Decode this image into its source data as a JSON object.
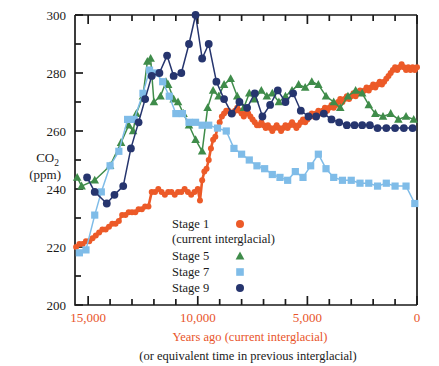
{
  "chart_data": {
    "type": "line",
    "title": "",
    "xlabel": "Years ago (current interglacial)",
    "xlabel_sub": "(or equivalent time in previous interglacial)",
    "ylabel_line1": "CO",
    "ylabel_sub": "2",
    "ylabel_line2": "(ppm)",
    "xlim": [
      15600,
      0
    ],
    "ylim": [
      200,
      300
    ],
    "x_reversed": true,
    "x_major_ticks": [
      15000,
      10000,
      5000,
      0
    ],
    "x_major_tick_labels": [
      "15,000",
      "10,000",
      "5,000",
      "0"
    ],
    "x_minor_tick_step": 1000,
    "y_major_ticks": [
      200,
      220,
      240,
      260,
      280,
      300
    ],
    "y_major_tick_labels": [
      "200",
      "220",
      "240",
      "260",
      "280",
      "300"
    ],
    "y_minor_tick_step": 10,
    "grid": false,
    "legend_position": "inside-lower-center",
    "colors": {
      "stage1": "#ec5a28",
      "stage5": "#3f8c4a",
      "stage7": "#7fbce8",
      "stage9": "#26356e",
      "axis": "#1a1a1a",
      "xaxis_text": "#e8542a"
    },
    "series": [
      {
        "name": "Stage 1",
        "sublabel": "(current interglacial)",
        "color": "#ec5a28",
        "marker": "circle",
        "points": [
          [
            15550,
            220
          ],
          [
            15400,
            221
          ],
          [
            15250,
            221
          ],
          [
            15100,
            222
          ],
          [
            14950,
            222
          ],
          [
            14800,
            223
          ],
          [
            14650,
            224
          ],
          [
            14500,
            225
          ],
          [
            14350,
            226
          ],
          [
            14200,
            226
          ],
          [
            14050,
            227
          ],
          [
            13900,
            228
          ],
          [
            13750,
            228
          ],
          [
            13600,
            229
          ],
          [
            13450,
            231
          ],
          [
            13300,
            231
          ],
          [
            13150,
            232
          ],
          [
            13000,
            232
          ],
          [
            12850,
            232
          ],
          [
            12700,
            233
          ],
          [
            12550,
            233
          ],
          [
            12400,
            234
          ],
          [
            12250,
            234
          ],
          [
            12100,
            239
          ],
          [
            11950,
            239
          ],
          [
            11800,
            240
          ],
          [
            11650,
            239
          ],
          [
            11500,
            238
          ],
          [
            11350,
            239
          ],
          [
            11200,
            239
          ],
          [
            11050,
            238
          ],
          [
            10900,
            239
          ],
          [
            10750,
            239
          ],
          [
            10600,
            240
          ],
          [
            10450,
            239
          ],
          [
            10300,
            238
          ],
          [
            10150,
            239
          ],
          [
            10000,
            240
          ],
          [
            9900,
            236
          ],
          [
            9800,
            243
          ],
          [
            9700,
            246
          ],
          [
            9600,
            247
          ],
          [
            9500,
            250
          ],
          [
            9400,
            254
          ],
          [
            9300,
            257
          ],
          [
            9200,
            258
          ],
          [
            9100,
            261
          ],
          [
            9000,
            263
          ],
          [
            8900,
            265
          ],
          [
            8800,
            266
          ],
          [
            8700,
            267
          ],
          [
            8600,
            267
          ],
          [
            8500,
            266
          ],
          [
            8400,
            266
          ],
          [
            8300,
            267
          ],
          [
            8200,
            268
          ],
          [
            8100,
            267
          ],
          [
            8000,
            266
          ],
          [
            7900,
            265
          ],
          [
            7800,
            266
          ],
          [
            7850,
            268
          ],
          [
            7700,
            266
          ],
          [
            7600,
            265
          ],
          [
            7500,
            264
          ],
          [
            7400,
            263
          ],
          [
            7300,
            262
          ],
          [
            7200,
            262
          ],
          [
            7100,
            263
          ],
          [
            7000,
            262
          ],
          [
            6900,
            261
          ],
          [
            6800,
            262
          ],
          [
            6700,
            261
          ],
          [
            6600,
            260
          ],
          [
            6500,
            261
          ],
          [
            6400,
            262
          ],
          [
            6300,
            261
          ],
          [
            6200,
            260
          ],
          [
            6100,
            261
          ],
          [
            6000,
            262
          ],
          [
            5900,
            261
          ],
          [
            5800,
            262
          ],
          [
            5700,
            263
          ],
          [
            5600,
            262
          ],
          [
            5500,
            261
          ],
          [
            5400,
            262
          ],
          [
            5300,
            263
          ],
          [
            5200,
            264
          ],
          [
            5100,
            263
          ],
          [
            5000,
            264
          ],
          [
            4900,
            265
          ],
          [
            4800,
            266
          ],
          [
            4700,
            265
          ],
          [
            4600,
            266
          ],
          [
            4500,
            267
          ],
          [
            4400,
            266
          ],
          [
            4300,
            267
          ],
          [
            4200,
            268
          ],
          [
            4100,
            267
          ],
          [
            4000,
            268
          ],
          [
            3900,
            269
          ],
          [
            3800,
            268
          ],
          [
            3700,
            269
          ],
          [
            3600,
            270
          ],
          [
            3500,
            271
          ],
          [
            3400,
            270
          ],
          [
            3300,
            271
          ],
          [
            3200,
            272
          ],
          [
            3100,
            271
          ],
          [
            3000,
            272
          ],
          [
            2900,
            273
          ],
          [
            2800,
            272
          ],
          [
            2700,
            273
          ],
          [
            2600,
            274
          ],
          [
            2500,
            273
          ],
          [
            2400,
            274
          ],
          [
            2300,
            275
          ],
          [
            2200,
            274
          ],
          [
            2100,
            275
          ],
          [
            2000,
            276
          ],
          [
            1900,
            275
          ],
          [
            1800,
            276
          ],
          [
            1700,
            277
          ],
          [
            1600,
            276
          ],
          [
            1500,
            277
          ],
          [
            1400,
            278
          ],
          [
            1300,
            279
          ],
          [
            1200,
            280
          ],
          [
            1100,
            281
          ],
          [
            1000,
            282
          ],
          [
            900,
            281
          ],
          [
            800,
            282
          ],
          [
            700,
            283
          ],
          [
            600,
            282
          ],
          [
            500,
            281
          ],
          [
            400,
            282
          ],
          [
            300,
            281
          ],
          [
            200,
            282
          ],
          [
            100,
            281
          ],
          [
            0,
            282
          ]
        ]
      },
      {
        "name": "Stage 5",
        "color": "#3f8c4a",
        "marker": "triangle",
        "points": [
          [
            15500,
            244
          ],
          [
            15300,
            241
          ],
          [
            14700,
            243
          ],
          [
            14000,
            248
          ],
          [
            13500,
            256
          ],
          [
            13150,
            262
          ],
          [
            12950,
            260
          ],
          [
            12800,
            266
          ],
          [
            12500,
            272
          ],
          [
            12300,
            284
          ],
          [
            12150,
            285
          ],
          [
            12000,
            270
          ],
          [
            11700,
            272
          ],
          [
            11450,
            277
          ],
          [
            11350,
            276
          ],
          [
            11100,
            271
          ],
          [
            10900,
            270
          ],
          [
            10650,
            266
          ],
          [
            10400,
            262
          ],
          [
            10100,
            257
          ],
          [
            9800,
            253
          ],
          [
            9550,
            268
          ],
          [
            9300,
            274
          ],
          [
            9050,
            272
          ],
          [
            8800,
            276
          ],
          [
            8500,
            278
          ],
          [
            8200,
            272
          ],
          [
            7900,
            268
          ],
          [
            7650,
            273
          ],
          [
            7400,
            271
          ],
          [
            7100,
            274
          ],
          [
            6850,
            272
          ],
          [
            6600,
            273
          ],
          [
            6300,
            270
          ],
          [
            6000,
            272
          ],
          [
            5700,
            274
          ],
          [
            5400,
            276
          ],
          [
            5100,
            275
          ],
          [
            4800,
            277
          ],
          [
            4500,
            276
          ],
          [
            4150,
            272
          ],
          [
            3800,
            270
          ],
          [
            3500,
            268
          ],
          [
            3150,
            272
          ],
          [
            2800,
            274
          ],
          [
            2500,
            273
          ],
          [
            2200,
            269
          ],
          [
            1900,
            266
          ],
          [
            1550,
            265
          ],
          [
            1200,
            266
          ],
          [
            850,
            264
          ],
          [
            500,
            265
          ],
          [
            150,
            264
          ]
        ]
      },
      {
        "name": "Stage 7",
        "color": "#7fbce8",
        "marker": "square",
        "points": [
          [
            15400,
            218
          ],
          [
            15100,
            219
          ],
          [
            14700,
            231
          ],
          [
            14400,
            239
          ],
          [
            14000,
            248
          ],
          [
            13600,
            253
          ],
          [
            13200,
            264
          ],
          [
            12900,
            264
          ],
          [
            12500,
            273
          ],
          [
            12200,
            281
          ],
          [
            11900,
            280
          ],
          [
            11600,
            277
          ],
          [
            11300,
            272
          ],
          [
            11000,
            266
          ],
          [
            10700,
            266
          ],
          [
            10400,
            263
          ],
          [
            10100,
            263
          ],
          [
            9800,
            262
          ],
          [
            9500,
            262
          ],
          [
            9100,
            261
          ],
          [
            8700,
            260
          ],
          [
            8350,
            254
          ],
          [
            8000,
            252
          ],
          [
            7650,
            250
          ],
          [
            7300,
            248
          ],
          [
            6950,
            247
          ],
          [
            6600,
            245
          ],
          [
            6250,
            244
          ],
          [
            5900,
            243
          ],
          [
            5550,
            246
          ],
          [
            5200,
            244
          ],
          [
            4850,
            248
          ],
          [
            4500,
            252
          ],
          [
            4150,
            247
          ],
          [
            3800,
            244
          ],
          [
            3400,
            243
          ],
          [
            3000,
            243
          ],
          [
            2600,
            242
          ],
          [
            2200,
            242
          ],
          [
            1800,
            241
          ],
          [
            1400,
            242
          ],
          [
            1000,
            241
          ],
          [
            500,
            241
          ],
          [
            100,
            235
          ]
        ]
      },
      {
        "name": "Stage 9",
        "color": "#26356e",
        "marker": "circle",
        "points": [
          [
            15050,
            244
          ],
          [
            14700,
            239
          ],
          [
            14150,
            235
          ],
          [
            13800,
            238
          ],
          [
            13400,
            241
          ],
          [
            13050,
            254
          ],
          [
            12700,
            263
          ],
          [
            12400,
            271
          ],
          [
            12100,
            279
          ],
          [
            11750,
            280
          ],
          [
            11400,
            286
          ],
          [
            11100,
            279
          ],
          [
            10750,
            280
          ],
          [
            10400,
            290
          ],
          [
            10100,
            300
          ],
          [
            9800,
            285
          ],
          [
            9500,
            290
          ],
          [
            9150,
            277
          ],
          [
            8800,
            271
          ],
          [
            8450,
            266
          ],
          [
            8100,
            270
          ],
          [
            7750,
            268
          ],
          [
            7400,
            273
          ],
          [
            7050,
            265
          ],
          [
            6700,
            269
          ],
          [
            6350,
            274
          ],
          [
            6000,
            270
          ],
          [
            5650,
            273
          ],
          [
            5300,
            267
          ],
          [
            4950,
            265
          ],
          [
            4600,
            265
          ],
          [
            4250,
            266
          ],
          [
            3900,
            264
          ],
          [
            3550,
            263
          ],
          [
            3200,
            262
          ],
          [
            2850,
            262
          ],
          [
            2500,
            262
          ],
          [
            2150,
            262
          ],
          [
            1800,
            261
          ],
          [
            1400,
            261
          ],
          [
            1000,
            261
          ],
          [
            600,
            261
          ],
          [
            200,
            261
          ]
        ]
      }
    ],
    "legend": [
      {
        "label": "Stage 1",
        "sublabel": "(current interglacial)",
        "marker": "circle",
        "color": "#ec5a28"
      },
      {
        "label": "Stage 5",
        "sublabel": "",
        "marker": "triangle",
        "color": "#3f8c4a"
      },
      {
        "label": "Stage 7",
        "sublabel": "",
        "marker": "square",
        "color": "#7fbce8"
      },
      {
        "label": "Stage 9",
        "sublabel": "",
        "marker": "circle",
        "color": "#26356e"
      }
    ]
  }
}
